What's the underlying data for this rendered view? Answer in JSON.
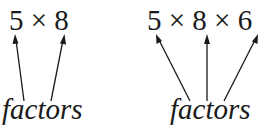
{
  "left": {
    "expression": "5 × 8",
    "label": "factors"
  },
  "right": {
    "expression": "5 × 8 × 6",
    "label": "factors"
  },
  "colors": {
    "ink": "#1a1a1a",
    "background": "#ffffff"
  }
}
